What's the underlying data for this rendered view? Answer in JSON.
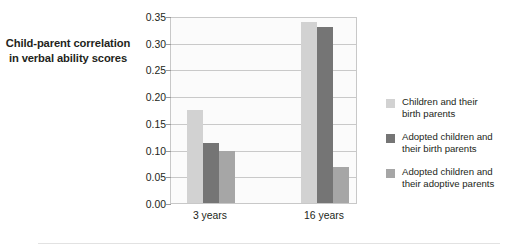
{
  "chart_data": {
    "type": "bar",
    "title": "",
    "subtitle": "",
    "xlabel": "",
    "ylabel": "Child-parent correlation in verbal ability scores",
    "ylabel_lines": [
      "Child-parent correlation",
      "in verbal ability scores"
    ],
    "categories": [
      "3 years",
      "16 years"
    ],
    "series": [
      {
        "name": "Children and their birth parents",
        "name_lines": [
          "Children and their",
          "birth parents"
        ],
        "color": "#d2d2d2",
        "values": [
          0.175,
          0.339
        ]
      },
      {
        "name": "Adopted children and their birth parents",
        "name_lines": [
          "Adopted children and",
          "their birth parents"
        ],
        "color": "#757575",
        "values": [
          0.112,
          0.329
        ]
      },
      {
        "name": "Adopted children and their adoptive parents",
        "name_lines": [
          "Adopted children and",
          "their adoptive parents"
        ],
        "color": "#a6a6a6",
        "values": [
          0.097,
          0.068
        ]
      }
    ],
    "ylim": [
      0.0,
      0.35
    ],
    "yticks": [
      0.0,
      0.05,
      0.1,
      0.15,
      0.2,
      0.25,
      0.3,
      0.35
    ],
    "ytick_labels": [
      "0.00",
      "0.05",
      "0.10",
      "0.15",
      "0.20",
      "0.25",
      "0.30",
      "0.35"
    ],
    "grid": true,
    "grid_axis": "y",
    "legend_position": "right",
    "plot_background": "#fbfbfb",
    "grid_color": "#c9c9c9",
    "text_color": "#231f20"
  }
}
